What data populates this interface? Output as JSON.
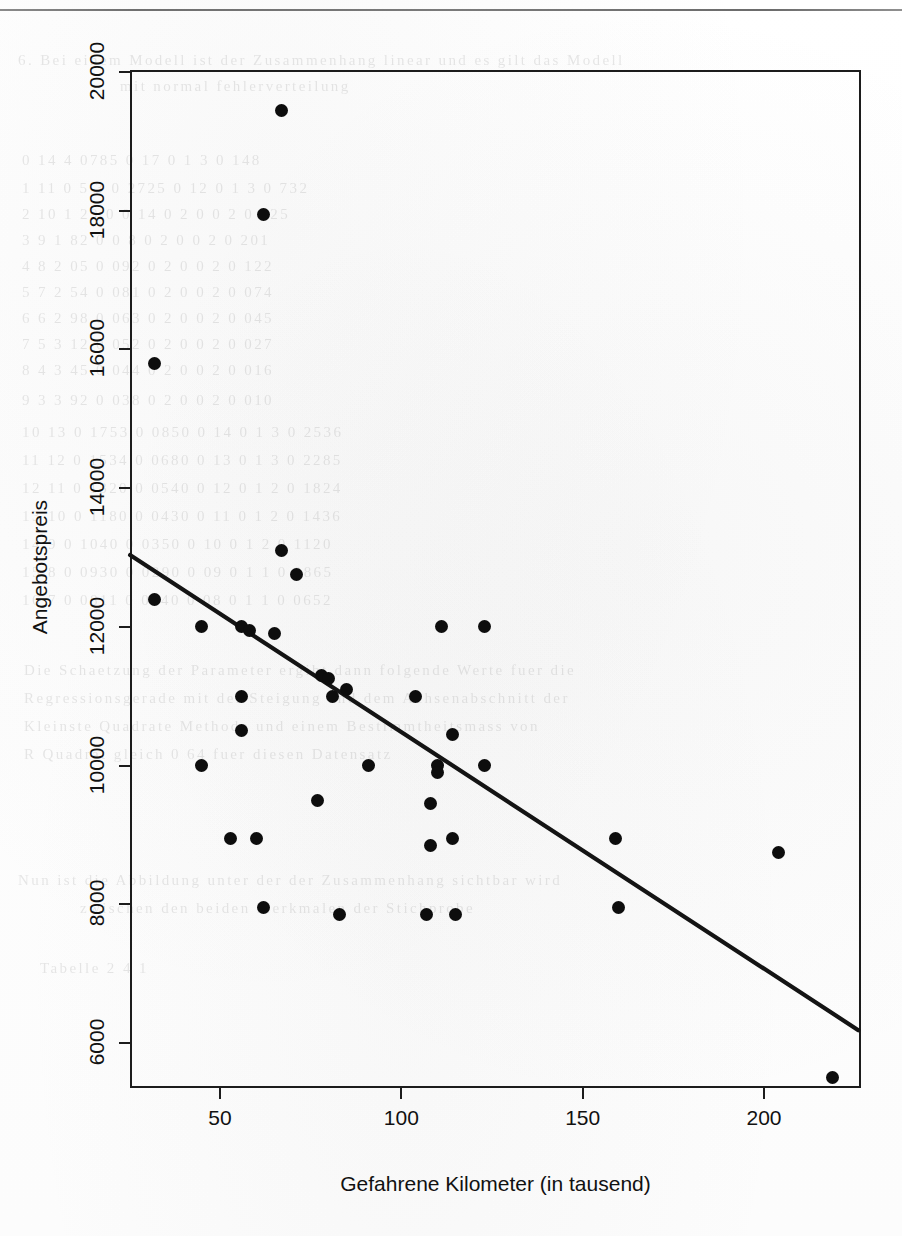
{
  "page": {
    "has_top_rule": true,
    "background_note": "scanned book page with faint bleed-through text"
  },
  "ghost_text": [
    {
      "text": "6. Bei einem Modell ist der Zusammenhang linear und es gilt das Modell",
      "x": 18,
      "y": 52
    },
    {
      "text": "mit normal fehlerverteilung",
      "x": 120,
      "y": 78
    },
    {
      "text": "0 14   4   0785   0   17    0   1  3   0 148",
      "x": 22,
      "y": 152
    },
    {
      "text": "1   11   0 5 3   0 2725   0   12   0   1   3   0   732",
      "x": 22,
      "y": 180
    },
    {
      "text": "2   10   1  29   0 0 14   0  2   0   0 2   0 325",
      "x": 22,
      "y": 206
    },
    {
      "text": "3    9   1 82   0 0  8   0  2   0   0 2   0 201",
      "x": 22,
      "y": 232
    },
    {
      "text": "4    8   2 05   0 092    0  2   0   0 2   0 122",
      "x": 22,
      "y": 258
    },
    {
      "text": "5    7   2 54   0 081    0  2   0   0 2   0 074",
      "x": 22,
      "y": 284
    },
    {
      "text": "6    6   2 98   0 063    0  2   0   0 2   0 045",
      "x": 22,
      "y": 310
    },
    {
      "text": "7    5   3 12   0 052    0  2   0   0 2   0 027",
      "x": 22,
      "y": 336
    },
    {
      "text": "8    4   3 45   0 044    0  2   0   0 2   0 016",
      "x": 22,
      "y": 362
    },
    {
      "text": "9    3   3 92   0 038    0  2   0   0 2   0 010",
      "x": 22,
      "y": 392
    },
    {
      "text": "10  13  0 1753  0 0850   0 14   0   1 3   0 2536",
      "x": 22,
      "y": 424
    },
    {
      "text": "11  12  0 1534  0 0680   0 13   0   1 3   0 2285",
      "x": 22,
      "y": 452
    },
    {
      "text": "12  11  0 1320  0 0540   0 12   0   1 2   0 1824",
      "x": 22,
      "y": 480
    },
    {
      "text": "13  10  0 1180  0 0430   0 11   0   1 2   0 1436",
      "x": 22,
      "y": 508
    },
    {
      "text": "14   9  0 1040  0 0350   0 10   0   1 2   0 1120",
      "x": 22,
      "y": 536
    },
    {
      "text": "15   8  0 0930  0 0290   0 09   0   1 1   0 0865",
      "x": 22,
      "y": 564
    },
    {
      "text": "16   7  0 0811  0 0240   0 08   0   1 1   0 0652",
      "x": 22,
      "y": 592
    },
    {
      "text": "Die Schaetzung der Parameter ergibt dann folgende Werte fuer die",
      "x": 24,
      "y": 662
    },
    {
      "text": "Regressionsgerade mit der Steigung und dem Achsenabschnitt der",
      "x": 24,
      "y": 690
    },
    {
      "text": "Kleinste Quadrate Methode und einem Bestimmtheitsmass von",
      "x": 24,
      "y": 718
    },
    {
      "text": "R Quadrat gleich 0 64 fuer diesen Datensatz",
      "x": 24,
      "y": 746
    },
    {
      "text": "Nun ist die Abbildung unter der der Zusammenhang sichtbar wird",
      "x": 18,
      "y": 872
    },
    {
      "text": "zwischen den beiden Merkmalen der Stichprobe",
      "x": 80,
      "y": 900
    },
    {
      "text": "Tabelle  2 4 1",
      "x": 40,
      "y": 960
    }
  ],
  "axes": {
    "y": {
      "title": "Angebotspreis",
      "ticks": [
        "6000",
        "8000",
        "10000",
        "12000",
        "14000",
        "16000",
        "18000",
        "20000"
      ],
      "tick_values": [
        6000,
        8000,
        10000,
        12000,
        14000,
        16000,
        18000,
        20000
      ],
      "range": [
        5200,
        20300
      ]
    },
    "x": {
      "title": "Gefahrene Kilometer (in tausend)",
      "ticks": [
        "50",
        "100",
        "150",
        "200"
      ],
      "tick_values": [
        50,
        100,
        150,
        200
      ],
      "range": [
        25,
        226
      ]
    }
  },
  "chart_data": {
    "type": "scatter",
    "title": "",
    "xlabel": "Gefahrene Kilometer (in tausend)",
    "ylabel": "Angebotspreis",
    "xlim": [
      25,
      226
    ],
    "ylim": [
      5200,
      20300
    ],
    "grid": false,
    "legend": "none",
    "point_color": "#0d0d0d",
    "line_color": "#141414",
    "points": [
      {
        "x": 67,
        "y": 19450
      },
      {
        "x": 62,
        "y": 17950
      },
      {
        "x": 32,
        "y": 15800
      },
      {
        "x": 67,
        "y": 13100
      },
      {
        "x": 71,
        "y": 12750
      },
      {
        "x": 32,
        "y": 12400
      },
      {
        "x": 45,
        "y": 12000
      },
      {
        "x": 56,
        "y": 12000
      },
      {
        "x": 58,
        "y": 11950
      },
      {
        "x": 65,
        "y": 11900
      },
      {
        "x": 111,
        "y": 12000
      },
      {
        "x": 123,
        "y": 12000
      },
      {
        "x": 78,
        "y": 11300
      },
      {
        "x": 80,
        "y": 11250
      },
      {
        "x": 85,
        "y": 11100
      },
      {
        "x": 56,
        "y": 11000
      },
      {
        "x": 81,
        "y": 11000
      },
      {
        "x": 104,
        "y": 11000
      },
      {
        "x": 56,
        "y": 10500
      },
      {
        "x": 114,
        "y": 10450
      },
      {
        "x": 45,
        "y": 10000
      },
      {
        "x": 91,
        "y": 10000
      },
      {
        "x": 110,
        "y": 10000
      },
      {
        "x": 123,
        "y": 10000
      },
      {
        "x": 110,
        "y": 9900
      },
      {
        "x": 77,
        "y": 9500
      },
      {
        "x": 108,
        "y": 9450
      },
      {
        "x": 53,
        "y": 8950
      },
      {
        "x": 60,
        "y": 8950
      },
      {
        "x": 114,
        "y": 8950
      },
      {
        "x": 159,
        "y": 8950
      },
      {
        "x": 204,
        "y": 8750
      },
      {
        "x": 108,
        "y": 8850
      },
      {
        "x": 62,
        "y": 7950
      },
      {
        "x": 83,
        "y": 7850
      },
      {
        "x": 107,
        "y": 7850
      },
      {
        "x": 115,
        "y": 7850
      },
      {
        "x": 160,
        "y": 7950
      },
      {
        "x": 219,
        "y": 5500
      }
    ],
    "regression_line": {
      "x1": 25.2,
      "y1": 13035,
      "x2": 226,
      "y2": 6185,
      "label": "Kleinste-Quadrate-Regressionsgerade"
    }
  }
}
